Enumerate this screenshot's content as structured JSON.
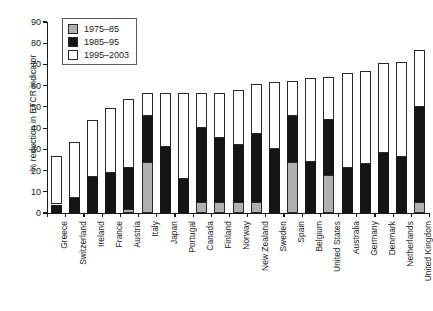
{
  "chart_data": {
    "type": "bar",
    "stacked": true,
    "title": "",
    "xlabel": "",
    "ylabel": "% reduction in ETCR indicator",
    "ylim": [
      0,
      90
    ],
    "yticks": [
      0,
      10,
      20,
      30,
      40,
      50,
      60,
      70,
      80,
      90
    ],
    "grid": false,
    "legend_position": "top-left",
    "categories": [
      "Greece",
      "Switzerland",
      "Ireland",
      "France",
      "Austria",
      "Italy",
      "Japan",
      "Portugal",
      "Canada",
      "Finland",
      "Norway",
      "New Zealand",
      "Sweden",
      "Spain",
      "Belgium",
      "United States",
      "Australia",
      "Germany",
      "Denmark",
      "Netherlands",
      "United Kingdom"
    ],
    "series": [
      {
        "name": "1975–85",
        "color": "#b0b0b0",
        "values": [
          0,
          0,
          0,
          0,
          2,
          24,
          0,
          0,
          5,
          5,
          5,
          5,
          0,
          24,
          0,
          18,
          0,
          0,
          0,
          0,
          5
        ]
      },
      {
        "name": "1985–95",
        "color": "#151515",
        "values": [
          4,
          7,
          17,
          19,
          21,
          45.5,
          31,
          16,
          40,
          35.5,
          32,
          37,
          30,
          45.5,
          24,
          44,
          21,
          23,
          28.5,
          26.5,
          50
        ]
      },
      {
        "name": "1995–2003",
        "color": "#ffffff",
        "values": [
          27,
          33.5,
          44,
          49.5,
          53.5,
          56.5,
          56.5,
          56.5,
          56.5,
          56.5,
          58,
          61,
          61.5,
          62,
          63.5,
          64,
          66,
          67,
          70.5,
          71,
          77
        ]
      }
    ],
    "note": "Each series value is the cumulative top of that segment in % reduction; segments stack: gray (1975-85) from 0, black (1985-95) up to its value, white (1995-2003) to the bar total."
  },
  "legend": {
    "items": [
      {
        "label": "1975–85",
        "swatch": "gray"
      },
      {
        "label": "1985–95",
        "swatch": "black"
      },
      {
        "label": "1995–2003",
        "swatch": "white"
      }
    ]
  }
}
